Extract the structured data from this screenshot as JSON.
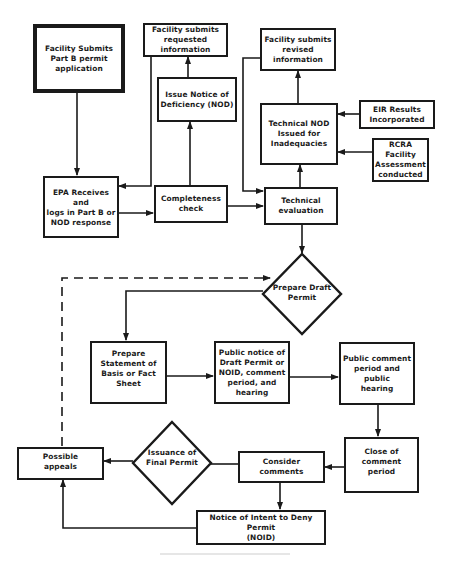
{
  "diagram": {
    "type": "flowchart",
    "nodes": {
      "submit_application": "Facility Submits\nPart B permit\napplication",
      "submit_requested_info": "Facility submits\nrequested\ninformation",
      "issue_nod": "Issue Notice of\nDeficiency (NOD)",
      "submit_revised_info": "Facility submits\nrevised\ninformation",
      "technical_nod": "Technical NOD\nIssued for\nInadequacies",
      "eir_results": "EIR Results\nIncorporated",
      "rcra_assessment": "RCRA Facility\nAssessment\nconducted",
      "epa_receives": "EPA Receives and\nlogs in Part B or\nNOD response",
      "completeness_check": "Completeness\ncheck",
      "technical_evaluation": "Technical\nevaluation",
      "prepare_draft_permit": "Prepare Draft\nPermit",
      "prepare_statement": "Prepare\nStatement of\nBasis or Fact\nSheet",
      "public_notice": "Public notice of\nDraft Permit or\nNOID, comment\nperiod, and\nhearing",
      "public_comment": "Public comment\nperiod and public\nhearing",
      "close_comment": "Close of\ncomment\nperiod",
      "consider_comments": "Consider comments",
      "issuance_final_permit": "Issuance of\nFinal Permit",
      "possible_appeals": "Possible\nappeals",
      "noid": "Notice of Intent to Deny Permit\n(NOID)"
    },
    "edges": [
      {
        "from": "submit_application",
        "to": "epa_receives"
      },
      {
        "from": "submit_requested_info",
        "to": "epa_receives"
      },
      {
        "from": "epa_receives",
        "to": "completeness_check"
      },
      {
        "from": "completeness_check",
        "to": "issue_nod"
      },
      {
        "from": "issue_nod",
        "to": "submit_requested_info"
      },
      {
        "from": "completeness_check",
        "to": "technical_evaluation"
      },
      {
        "from": "submit_revised_info",
        "to": "technical_evaluation"
      },
      {
        "from": "technical_evaluation",
        "to": "technical_nod"
      },
      {
        "from": "technical_nod",
        "to": "submit_revised_info"
      },
      {
        "from": "eir_results",
        "to": "technical_nod"
      },
      {
        "from": "rcra_assessment",
        "to": "technical_nod"
      },
      {
        "from": "technical_evaluation",
        "to": "prepare_draft_permit"
      },
      {
        "from": "prepare_draft_permit",
        "to": "prepare_statement"
      },
      {
        "from": "prepare_statement",
        "to": "public_notice"
      },
      {
        "from": "public_notice",
        "to": "public_comment"
      },
      {
        "from": "public_comment",
        "to": "close_comment"
      },
      {
        "from": "close_comment",
        "to": "consider_comments"
      },
      {
        "from": "consider_comments",
        "to": "issuance_final_permit"
      },
      {
        "from": "issuance_final_permit",
        "to": "possible_appeals"
      },
      {
        "from": "consider_comments",
        "to": "noid"
      },
      {
        "from": "noid",
        "to": "possible_appeals"
      },
      {
        "from": "possible_appeals",
        "to": "prepare_draft_permit",
        "style": "dashed"
      }
    ],
    "colors": {
      "stroke": "#1a1a1a",
      "background": "#ffffff"
    }
  }
}
